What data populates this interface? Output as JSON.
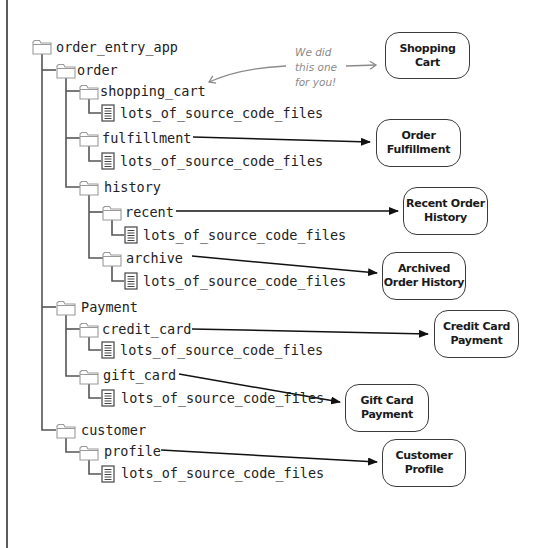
{
  "tree": {
    "root": {
      "label": "order_entry_app",
      "type": "folder"
    },
    "nodes": [
      {
        "id": "order",
        "label": "order",
        "type": "folder",
        "depth": 1
      },
      {
        "id": "shopping_cart",
        "label": "shopping_cart",
        "type": "folder",
        "depth": 2
      },
      {
        "id": "shopping_cart_files",
        "label": "lots_of_source_code_files",
        "type": "file",
        "depth": 3
      },
      {
        "id": "fulfillment",
        "label": "fulfillment",
        "type": "folder",
        "depth": 2
      },
      {
        "id": "fulfillment_files",
        "label": "lots_of_source_code_files",
        "type": "file",
        "depth": 3
      },
      {
        "id": "history",
        "label": "history",
        "type": "folder",
        "depth": 2
      },
      {
        "id": "recent",
        "label": "recent",
        "type": "folder",
        "depth": 3
      },
      {
        "id": "recent_files",
        "label": "lots_of_source_code_files",
        "type": "file",
        "depth": 4
      },
      {
        "id": "archive",
        "label": "archive",
        "type": "folder",
        "depth": 3
      },
      {
        "id": "archive_files",
        "label": "lots_of_source_code_files",
        "type": "file",
        "depth": 4
      },
      {
        "id": "payment",
        "label": "Payment",
        "type": "folder",
        "depth": 1
      },
      {
        "id": "credit_card",
        "label": "credit_card",
        "type": "folder",
        "depth": 2
      },
      {
        "id": "credit_card_files",
        "label": "lots_of_source_code_files",
        "type": "file",
        "depth": 3
      },
      {
        "id": "gift_card",
        "label": "gift_card",
        "type": "folder",
        "depth": 2
      },
      {
        "id": "gift_card_files",
        "label": "lots_of_source_code_files",
        "type": "file",
        "depth": 3
      },
      {
        "id": "customer",
        "label": "customer",
        "type": "folder",
        "depth": 1
      },
      {
        "id": "profile",
        "label": "profile",
        "type": "folder",
        "depth": 2
      },
      {
        "id": "profile_files",
        "label": "lots_of_source_code_files",
        "type": "file",
        "depth": 3
      }
    ]
  },
  "components": [
    {
      "id": "shopping_cart_box",
      "line1": "Shopping",
      "line2": "Cart"
    },
    {
      "id": "order_fulfillment_box",
      "line1": "Order",
      "line2": "Fulfillment"
    },
    {
      "id": "recent_order_history_box",
      "line1": "Recent Order",
      "line2": "History"
    },
    {
      "id": "archived_order_history_box",
      "line1": "Archived",
      "line2": "Order History"
    },
    {
      "id": "credit_card_payment_box",
      "line1": "Credit Card",
      "line2": "Payment"
    },
    {
      "id": "gift_card_payment_box",
      "line1": "Gift Card",
      "line2": "Payment"
    },
    {
      "id": "customer_profile_box",
      "line1": "Customer",
      "line2": "Profile"
    }
  ],
  "annotation": {
    "line1": "We did",
    "line2": "this one",
    "line3": "for you!"
  },
  "colors": {
    "tree_line": "#555555",
    "folder_stroke": "#9a9a9a",
    "arrow": "#111111",
    "annotation": "#8a8a8a"
  }
}
